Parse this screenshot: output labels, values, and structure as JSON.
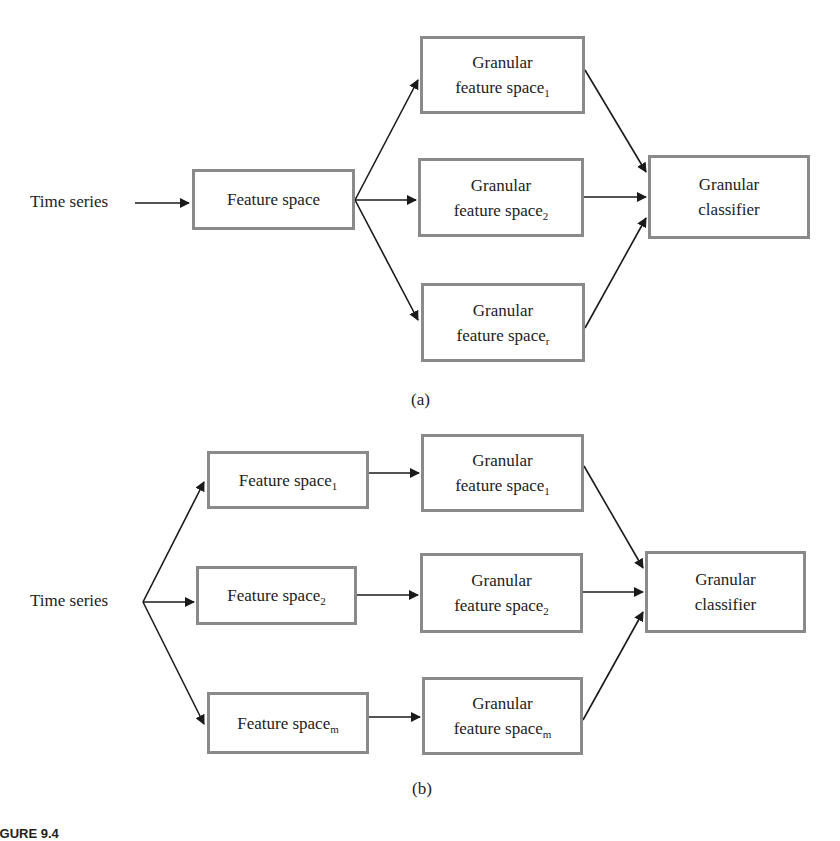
{
  "diagram_a": {
    "panel_label": "(a)",
    "input_label": "Time series",
    "feature_space": {
      "label": "Feature space"
    },
    "granular_spaces": [
      {
        "line1": "Granular",
        "line2": "feature space",
        "subscript": "1"
      },
      {
        "line1": "Granular",
        "line2": "feature space",
        "subscript": "2"
      },
      {
        "line1": "Granular",
        "line2": "feature space",
        "subscript": "r"
      }
    ],
    "classifier": {
      "line1": "Granular",
      "line2": "classifier"
    }
  },
  "diagram_b": {
    "panel_label": "(b)",
    "input_label": "Time series",
    "feature_spaces": [
      {
        "label": "Feature space",
        "subscript": "1"
      },
      {
        "label": "Feature space",
        "subscript": "2"
      },
      {
        "label": "Feature space",
        "subscript": "m"
      }
    ],
    "granular_spaces": [
      {
        "line1": "Granular",
        "line2": "feature space",
        "subscript": "1"
      },
      {
        "line1": "Granular",
        "line2": "feature space",
        "subscript": "2"
      },
      {
        "line1": "Granular",
        "line2": "feature space",
        "subscript": "m"
      }
    ],
    "classifier": {
      "line1": "Granular",
      "line2": "classifier"
    }
  },
  "caption": {
    "text": "IGURE 9.4"
  },
  "colors": {
    "box_border": "#8a8a8a",
    "arrow": "#1a1a1a",
    "text": "#222222"
  }
}
